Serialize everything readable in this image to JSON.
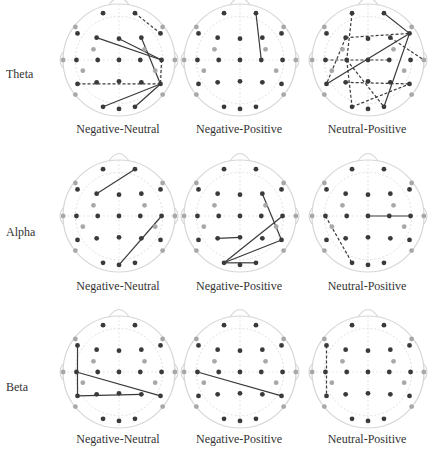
{
  "figure": {
    "rows": [
      {
        "band": "Theta",
        "label_y": 75
      },
      {
        "band": "Alpha",
        "label_y": 233
      },
      {
        "band": "Beta",
        "label_y": 388
      }
    ],
    "columns": [
      "Negative-Neutral",
      "Negative-Positive",
      "Neutral-Positive"
    ],
    "colors": {
      "inner_electrode": "#3a3a3a",
      "outer_electrode": "#a8a8a8",
      "outline": "#d6d6d6",
      "solid_edge": "#3a3a3a",
      "dashed_edge": "#3a3a3a"
    }
  },
  "electrodes": {
    "FP1": [
      -0.3,
      -0.88,
      "in"
    ],
    "FP2": [
      0.3,
      -0.88,
      "in"
    ],
    "AF7": [
      -0.82,
      -0.62,
      "out"
    ],
    "AF8": [
      0.82,
      -0.62,
      "out"
    ],
    "F7": [
      -0.78,
      -0.5,
      "in"
    ],
    "F3": [
      -0.42,
      -0.42,
      "in"
    ],
    "Fz": [
      0,
      -0.4,
      "in"
    ],
    "F4": [
      0.42,
      -0.42,
      "in"
    ],
    "F8": [
      0.78,
      -0.5,
      "in"
    ],
    "FC5": [
      -0.48,
      -0.2,
      "out"
    ],
    "FC6": [
      0.48,
      -0.2,
      "out"
    ],
    "T9": [
      -1.05,
      0,
      "out"
    ],
    "T7": [
      -0.8,
      0,
      "in"
    ],
    "C3": [
      -0.4,
      0,
      "in"
    ],
    "Cz": [
      0,
      0,
      "in"
    ],
    "C4": [
      0.4,
      0,
      "in"
    ],
    "T8": [
      0.8,
      0,
      "in"
    ],
    "T10": [
      1.05,
      0,
      "out"
    ],
    "CP5": [
      -0.68,
      0.2,
      "out"
    ],
    "CP6": [
      0.68,
      0.2,
      "out"
    ],
    "P7": [
      -0.78,
      0.45,
      "in"
    ],
    "P3": [
      -0.42,
      0.42,
      "in"
    ],
    "Pz": [
      0,
      0.4,
      "in"
    ],
    "P4": [
      0.42,
      0.42,
      "in"
    ],
    "P8": [
      0.78,
      0.45,
      "in"
    ],
    "PO7": [
      -0.82,
      0.65,
      "out"
    ],
    "PO8": [
      0.82,
      0.65,
      "out"
    ],
    "O1": [
      -0.3,
      0.88,
      "in"
    ],
    "Oz": [
      0,
      0.92,
      "in"
    ],
    "O2": [
      0.3,
      0.88,
      "in"
    ]
  },
  "panels": [
    {
      "row": 0,
      "col": 0,
      "cx": 119,
      "cy": 60,
      "edges": [
        {
          "a": "F3",
          "b": "T8",
          "style": "solid"
        },
        {
          "a": "Fz",
          "b": "T8",
          "style": "solid"
        },
        {
          "a": "F4",
          "b": "P8",
          "style": "solid"
        },
        {
          "a": "O1",
          "b": "P8",
          "style": "solid"
        },
        {
          "a": "O2",
          "b": "P8",
          "style": "solid"
        },
        {
          "a": "FP2",
          "b": "F8",
          "style": "dashed"
        },
        {
          "a": "P7",
          "b": "P8",
          "style": "dashed"
        },
        {
          "a": "T8",
          "b": "P8",
          "style": "dashed"
        }
      ]
    },
    {
      "row": 0,
      "col": 1,
      "cx": 240,
      "cy": 60,
      "edges": [
        {
          "a": "FP2",
          "b": "C4",
          "style": "solid"
        }
      ]
    },
    {
      "row": 0,
      "col": 2,
      "cx": 368,
      "cy": 60,
      "edges": [
        {
          "a": "FP2",
          "b": "F8",
          "style": "solid"
        },
        {
          "a": "F8",
          "b": "P7",
          "style": "solid"
        },
        {
          "a": "F8",
          "b": "O2",
          "style": "solid"
        },
        {
          "a": "F3",
          "b": "F8",
          "style": "dashed"
        },
        {
          "a": "F3",
          "b": "P7",
          "style": "dashed"
        },
        {
          "a": "FP1",
          "b": "C3",
          "style": "dashed"
        },
        {
          "a": "T7",
          "b": "C4",
          "style": "dashed"
        },
        {
          "a": "C3",
          "b": "O1",
          "style": "dashed"
        },
        {
          "a": "C3",
          "b": "O2",
          "style": "dashed"
        },
        {
          "a": "F4",
          "b": "T10",
          "style": "dashed"
        },
        {
          "a": "O1",
          "b": "P8",
          "style": "dashed"
        },
        {
          "a": "P3",
          "b": "P8",
          "style": "dashed"
        }
      ]
    },
    {
      "row": 1,
      "col": 0,
      "cx": 119,
      "cy": 216,
      "edges": [
        {
          "a": "F3",
          "b": "FP2",
          "style": "solid"
        },
        {
          "a": "Oz",
          "b": "T8",
          "style": "solid"
        }
      ]
    },
    {
      "row": 1,
      "col": 1,
      "cx": 240,
      "cy": 216,
      "edges": [
        {
          "a": "F4",
          "b": "P8",
          "style": "solid"
        },
        {
          "a": "O1",
          "b": "P8",
          "style": "solid"
        },
        {
          "a": "O1",
          "b": "T8",
          "style": "solid"
        },
        {
          "a": "O1",
          "b": "O2",
          "style": "solid"
        },
        {
          "a": "P3",
          "b": "Pz",
          "style": "solid"
        }
      ]
    },
    {
      "row": 1,
      "col": 2,
      "cx": 368,
      "cy": 216,
      "edges": [
        {
          "a": "Cz",
          "b": "T8",
          "style": "solid"
        },
        {
          "a": "T7",
          "b": "O1",
          "style": "dashed"
        }
      ]
    },
    {
      "row": 2,
      "col": 0,
      "cx": 119,
      "cy": 372,
      "edges": [
        {
          "a": "F7",
          "b": "P7",
          "style": "solid"
        },
        {
          "a": "P7",
          "b": "P4",
          "style": "solid"
        },
        {
          "a": "T7",
          "b": "P8",
          "style": "solid"
        }
      ]
    },
    {
      "row": 2,
      "col": 1,
      "cx": 240,
      "cy": 372,
      "edges": [
        {
          "a": "T7",
          "b": "P8",
          "style": "solid"
        }
      ]
    },
    {
      "row": 2,
      "col": 2,
      "cx": 368,
      "cy": 372,
      "edges": [
        {
          "a": "F7",
          "b": "P7",
          "style": "dashed"
        }
      ]
    }
  ],
  "layout": {
    "radius": 56,
    "col_label_y": [
      130,
      287,
      440
    ],
    "col_label_x": [
      53,
      174,
      302
    ]
  }
}
